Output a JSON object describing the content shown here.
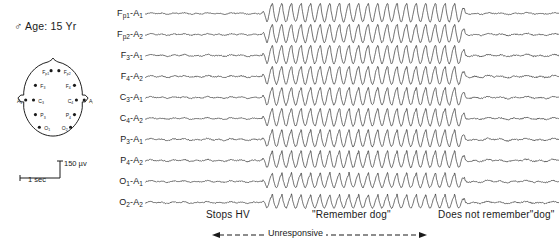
{
  "patient": {
    "sex_symbol": "♂",
    "info_text": "Age: 15 Yr"
  },
  "head_map": {
    "name": "electrode-placement-diagram",
    "electrodes": [
      {
        "id": "Fp1",
        "label": "F",
        "sub": "p1",
        "x": 30,
        "y": 20,
        "dot_side": "right"
      },
      {
        "id": "Fp2",
        "label": "F",
        "sub": "p2",
        "x": 52,
        "y": 20,
        "dot_side": "left"
      },
      {
        "id": "F3",
        "label": "F",
        "sub": "3",
        "x": 28,
        "y": 35,
        "dot_side": "left"
      },
      {
        "id": "F4",
        "label": "F",
        "sub": "4",
        "x": 54,
        "y": 35,
        "dot_side": "right"
      },
      {
        "id": "C3",
        "label": "C",
        "sub": "3",
        "x": 26,
        "y": 50,
        "dot_side": "left"
      },
      {
        "id": "C4",
        "label": "C",
        "sub": "4",
        "x": 56,
        "y": 50,
        "dot_side": "right"
      },
      {
        "id": "P3",
        "label": "P",
        "sub": "3",
        "x": 28,
        "y": 65,
        "dot_side": "left"
      },
      {
        "id": "P4",
        "label": "P",
        "sub": "4",
        "x": 54,
        "y": 65,
        "dot_side": "right"
      },
      {
        "id": "O1",
        "label": "O",
        "sub": "1",
        "x": 32,
        "y": 78,
        "dot_side": "left"
      },
      {
        "id": "O2",
        "label": "O",
        "sub": "2",
        "x": 50,
        "y": 78,
        "dot_side": "right"
      },
      {
        "id": "A1",
        "label": "A",
        "sub": "1",
        "x": 4,
        "y": 50,
        "dot_side": "right"
      },
      {
        "id": "A2",
        "label": "A",
        "sub": "2",
        "x": 78,
        "y": 50,
        "dot_side": "left"
      }
    ]
  },
  "calibration": {
    "amplitude_label": "150 µv",
    "time_label": "1 sec"
  },
  "channels": [
    {
      "name": "Fp1-A1",
      "base": "F",
      "sub1": "p1",
      "ref": "A",
      "sub2": "1"
    },
    {
      "name": "Fp2-A2",
      "base": "F",
      "sub1": "p2",
      "ref": "A",
      "sub2": "2"
    },
    {
      "name": "F3-A1",
      "base": "F",
      "sub1": "3",
      "ref": "A",
      "sub2": "1"
    },
    {
      "name": "F4-A2",
      "base": "F",
      "sub1": "4",
      "ref": "A",
      "sub2": "2"
    },
    {
      "name": "C3-A1",
      "base": "C",
      "sub1": "3",
      "ref": "A",
      "sub2": "1"
    },
    {
      "name": "C4-A2",
      "base": "C",
      "sub1": "4",
      "ref": "A",
      "sub2": "2"
    },
    {
      "name": "P3-A1",
      "base": "P",
      "sub1": "3",
      "ref": "A",
      "sub2": "1"
    },
    {
      "name": "P4-A2",
      "base": "P",
      "sub1": "4",
      "ref": "A",
      "sub2": "2"
    },
    {
      "name": "O1-A1",
      "base": "O",
      "sub1": "1",
      "ref": "A",
      "sub2": "1"
    },
    {
      "name": "O2-A2",
      "base": "O",
      "sub1": "2",
      "ref": "A",
      "sub2": "2"
    }
  ],
  "events": {
    "stops_hv": "Stops HV",
    "remember_dog": "\"Remember dog\"",
    "does_not_remember": "Does not remember\"dog\"",
    "unresponsive": "Unresponsive"
  },
  "chart_data": {
    "type": "line",
    "xlabel": "Time",
    "ylabel": "Channel",
    "grid": false,
    "legend": "none",
    "amplitude_calibration_uv": 150,
    "time_calibration_sec": 1,
    "trace_pixel_width": 414,
    "segments": [
      {
        "name": "pre-ictal background",
        "x_start": 0,
        "x_end": 117,
        "pattern": "low-amplitude mixed frequency",
        "amplitude": 0.16,
        "frequency_hz": 9
      },
      {
        "name": "ictal burst (spike-and-wave)",
        "x_start": 117,
        "x_end": 322,
        "pattern": "3 Hz spike-and-wave",
        "amplitude": 1.0,
        "frequency_hz": 3
      },
      {
        "name": "post-ictal background",
        "x_start": 322,
        "x_end": 414,
        "pattern": "low-amplitude mixed frequency",
        "amplitude": 0.2,
        "frequency_hz": 8
      }
    ],
    "series": [
      {
        "name": "Fp1-A1",
        "burst_amplitude": 1.0,
        "base_amplitude": 0.16,
        "seed": 11
      },
      {
        "name": "Fp2-A2",
        "burst_amplitude": 0.96,
        "base_amplitude": 0.17,
        "seed": 23
      },
      {
        "name": "F3-A1",
        "burst_amplitude": 0.98,
        "base_amplitude": 0.2,
        "seed": 37
      },
      {
        "name": "F4-A2",
        "burst_amplitude": 0.94,
        "base_amplitude": 0.22,
        "seed": 51
      },
      {
        "name": "C3-A1",
        "burst_amplitude": 0.92,
        "base_amplitude": 0.18,
        "seed": 67
      },
      {
        "name": "C4-A2",
        "burst_amplitude": 0.9,
        "base_amplitude": 0.18,
        "seed": 83
      },
      {
        "name": "P3-A1",
        "burst_amplitude": 0.86,
        "base_amplitude": 0.21,
        "seed": 97
      },
      {
        "name": "P4-A2",
        "burst_amplitude": 0.84,
        "base_amplitude": 0.21,
        "seed": 109
      },
      {
        "name": "O1-A1",
        "burst_amplitude": 0.72,
        "base_amplitude": 0.19,
        "seed": 127
      },
      {
        "name": "O2-A2",
        "burst_amplitude": 0.66,
        "base_amplitude": 0.19,
        "seed": 149
      }
    ]
  },
  "colors": {
    "ink": "#1a1a1a",
    "background": "#ffffff"
  }
}
